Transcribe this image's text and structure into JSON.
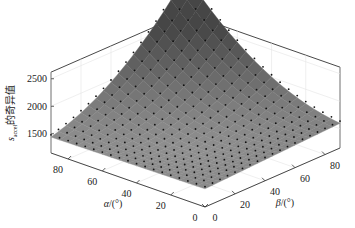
{
  "chart_data": {
    "type": "surface3d",
    "title": "",
    "zlabel": "s_accel的奇异值",
    "zlabel_main": "s",
    "zlabel_sub": "accel",
    "zlabel_suffix": "的奇异值",
    "xlabel": "α/(°)",
    "xlabel_sym": "α",
    "xlabel_unit": "/(°)",
    "ylabel": "β/(°)",
    "ylabel_sym": "β",
    "ylabel_unit": "/(°)",
    "x_ticks": [
      "0",
      "20",
      "40",
      "60",
      "80"
    ],
    "y_ticks": [
      "0",
      "20",
      "40",
      "60",
      "80"
    ],
    "z_ticks": [
      "1500",
      "2000",
      "2500"
    ],
    "xlim": [
      0,
      90
    ],
    "ylim": [
      0,
      90
    ],
    "zlim": [
      1150,
      2750
    ],
    "grid": true,
    "surface_color_low": "#c8c8c8",
    "surface_color_high": "#5a5a5a",
    "marker_color": "#111111",
    "grid_points": 19,
    "sample_values": [
      {
        "alpha": 90,
        "beta": 90,
        "value": 2620
      },
      {
        "alpha": 90,
        "beta": 0,
        "value": 1450
      },
      {
        "alpha": 0,
        "beta": 90,
        "value": 1700
      },
      {
        "alpha": 0,
        "beta": 0,
        "value": 1500
      },
      {
        "alpha": 45,
        "beta": 45,
        "value": 1550
      },
      {
        "alpha": 90,
        "beta": 45,
        "value": 1850
      },
      {
        "alpha": 45,
        "beta": 90,
        "value": 1900
      }
    ]
  }
}
